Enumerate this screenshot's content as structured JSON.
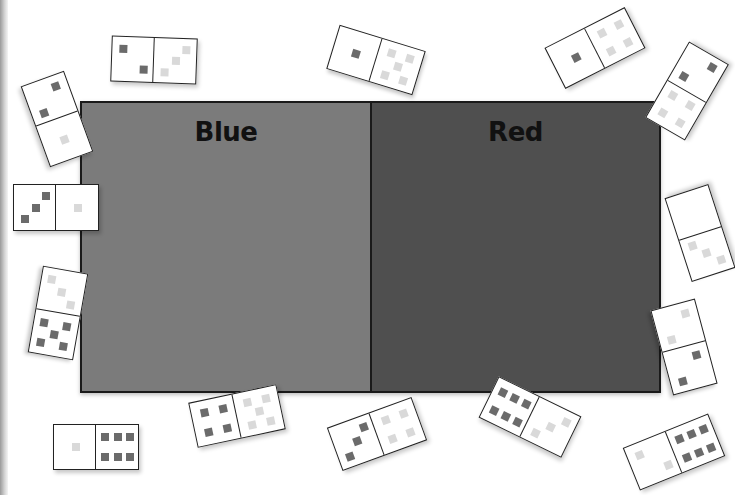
{
  "board": {
    "zones": [
      {
        "label": "Blue",
        "color": "#7b7b7b"
      },
      {
        "label": "Red",
        "color": "#4f4f4f"
      }
    ]
  },
  "pip_colors": {
    "dark": "#6b6b6b",
    "light": "#d9d9d9"
  },
  "dominoes": [
    {
      "id": "d1",
      "x": 111,
      "y": 37,
      "w": 86,
      "h": 46,
      "rot": 2,
      "left": {
        "n": 2,
        "tone": "dark"
      },
      "right": {
        "n": 3,
        "tone": "light"
      }
    },
    {
      "id": "d2",
      "x": 14,
      "y": 96,
      "w": 86,
      "h": 46,
      "rot": 70,
      "left": {
        "n": 2,
        "tone": "dark"
      },
      "right": {
        "n": 1,
        "tone": "light"
      }
    },
    {
      "id": "d3",
      "x": 13,
      "y": 184,
      "w": 86,
      "h": 47,
      "rot": 0,
      "left": {
        "n": 3,
        "tone": "dark"
      },
      "right": {
        "n": 1,
        "tone": "light"
      }
    },
    {
      "id": "d4",
      "x": 331,
      "y": 37,
      "w": 90,
      "h": 46,
      "rot": 17,
      "left": {
        "n": 1,
        "tone": "dark"
      },
      "right": {
        "n": 5,
        "tone": "light"
      }
    },
    {
      "id": "d5",
      "x": 550,
      "y": 25,
      "w": 90,
      "h": 46,
      "rot": -27,
      "left": {
        "n": 1,
        "tone": "dark"
      },
      "right": {
        "n": 4,
        "tone": "light"
      }
    },
    {
      "id": "d6",
      "x": 643,
      "y": 68,
      "w": 88,
      "h": 46,
      "rot": -60,
      "left": {
        "n": 4,
        "tone": "light"
      },
      "right": {
        "n": 2,
        "tone": "dark"
      }
    },
    {
      "id": "d7",
      "x": 656,
      "y": 210,
      "w": 88,
      "h": 46,
      "rot": -108,
      "left": {
        "n": 3,
        "tone": "light"
      },
      "right": {
        "n": 0,
        "tone": "light"
      }
    },
    {
      "id": "d8",
      "x": 14,
      "y": 290,
      "w": 88,
      "h": 46,
      "rot": 100,
      "left": {
        "n": 3,
        "tone": "light"
      },
      "right": {
        "n": 5,
        "tone": "dark"
      }
    },
    {
      "id": "d9",
      "x": 640,
      "y": 324,
      "w": 88,
      "h": 46,
      "rot": 75,
      "left": {
        "n": 2,
        "tone": "light"
      },
      "right": {
        "n": 2,
        "tone": "dark"
      }
    },
    {
      "id": "d10",
      "x": 53,
      "y": 424,
      "w": 86,
      "h": 46,
      "rot": 0,
      "left": {
        "n": 1,
        "tone": "light"
      },
      "right": {
        "n": 6,
        "tone": "dark"
      }
    },
    {
      "id": "d11",
      "x": 192,
      "y": 393,
      "w": 90,
      "h": 46,
      "rot": -12,
      "left": {
        "n": 4,
        "tone": "dark"
      },
      "right": {
        "n": 5,
        "tone": "light"
      }
    },
    {
      "id": "d12",
      "x": 332,
      "y": 411,
      "w": 90,
      "h": 46,
      "rot": -20,
      "left": {
        "n": 3,
        "tone": "dark"
      },
      "right": {
        "n": 4,
        "tone": "light"
      }
    },
    {
      "id": "d13",
      "x": 484,
      "y": 394,
      "w": 92,
      "h": 46,
      "rot": 26,
      "left": {
        "n": 6,
        "tone": "dark"
      },
      "right": {
        "n": 3,
        "tone": "light"
      }
    },
    {
      "id": "d14",
      "x": 628,
      "y": 429,
      "w": 92,
      "h": 46,
      "rot": -22,
      "left": {
        "n": 2,
        "tone": "light"
      },
      "right": {
        "n": 6,
        "tone": "dark"
      }
    }
  ]
}
